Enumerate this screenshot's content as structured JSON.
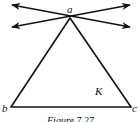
{
  "figure": {
    "caption": "Figure 7.27",
    "labels": {
      "apex": "a",
      "left": "b",
      "right": "c",
      "region": "K"
    },
    "geometry": {
      "apex": [
        70,
        18
      ],
      "b": [
        11,
        107
      ],
      "c": [
        131,
        107
      ],
      "line1": {
        "from": [
          12,
          5
        ],
        "to": [
          130,
          27
        ]
      },
      "line2": {
        "from": [
          12,
          27
        ],
        "to": [
          130,
          5
        ]
      }
    },
    "stroke_color": "#111111"
  }
}
